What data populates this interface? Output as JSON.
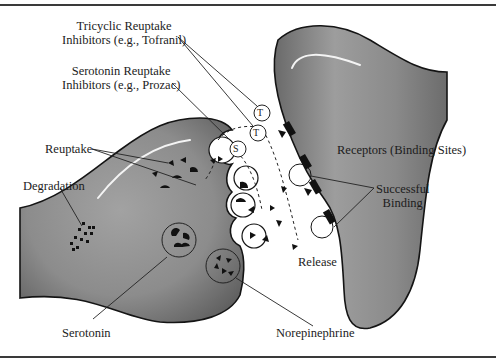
{
  "diagram": {
    "type": "synapse-illustration",
    "labels": {
      "tricyclic": [
        "Tricyclic Reuptake",
        "Inhibitors (e.g., Tofranil)"
      ],
      "ssri": [
        "Serotonin Reuptake",
        "Inhibitors (e.g., Prozac)"
      ],
      "reuptake": "Reuptake",
      "degradation": "Degradation",
      "receptors": "Receptors (Binding Sites)",
      "successful_binding": [
        "Successful",
        "Binding"
      ],
      "release": "Release",
      "serotonin": "Serotonin",
      "norepinephrine": "Norepinephrine"
    },
    "markers": {
      "tricyclic_a": "T",
      "tricyclic_b": "T",
      "ssri": "S"
    },
    "colors": {
      "neuron_fill": "#8e8e8e",
      "neuron_dark": "#5e5e5e",
      "outline": "#141414",
      "background": "#ffffff",
      "rule": "#3a3a3a"
    }
  }
}
